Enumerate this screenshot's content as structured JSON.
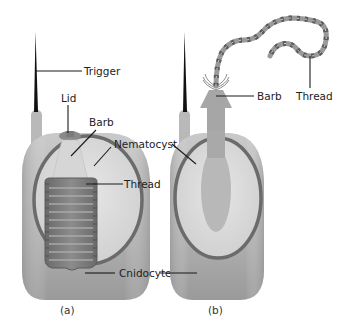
{
  "figure": {
    "panels": [
      {
        "caption": "(a)",
        "state": "undischarged",
        "labels": {
          "trigger": "Trigger",
          "lid": "Lid",
          "barb": "Barb",
          "nematocyst": "Nematocyst",
          "thread": "Thread",
          "cnidocyte": "Cnidocyte"
        }
      },
      {
        "caption": "(b)",
        "state": "discharged",
        "labels": {
          "barb": "Barb",
          "thread": "Thread"
        }
      }
    ],
    "colors": {
      "cell_body": "#a9a9a9",
      "cell_body_light": "#c4c4c4",
      "capsule_wall": "#6e6e6e",
      "capsule_fill": "#dcdcdc",
      "thread_coil": "#7a7a7a",
      "trigger": "#111111",
      "leader_lines": "#1a1a1a"
    }
  }
}
